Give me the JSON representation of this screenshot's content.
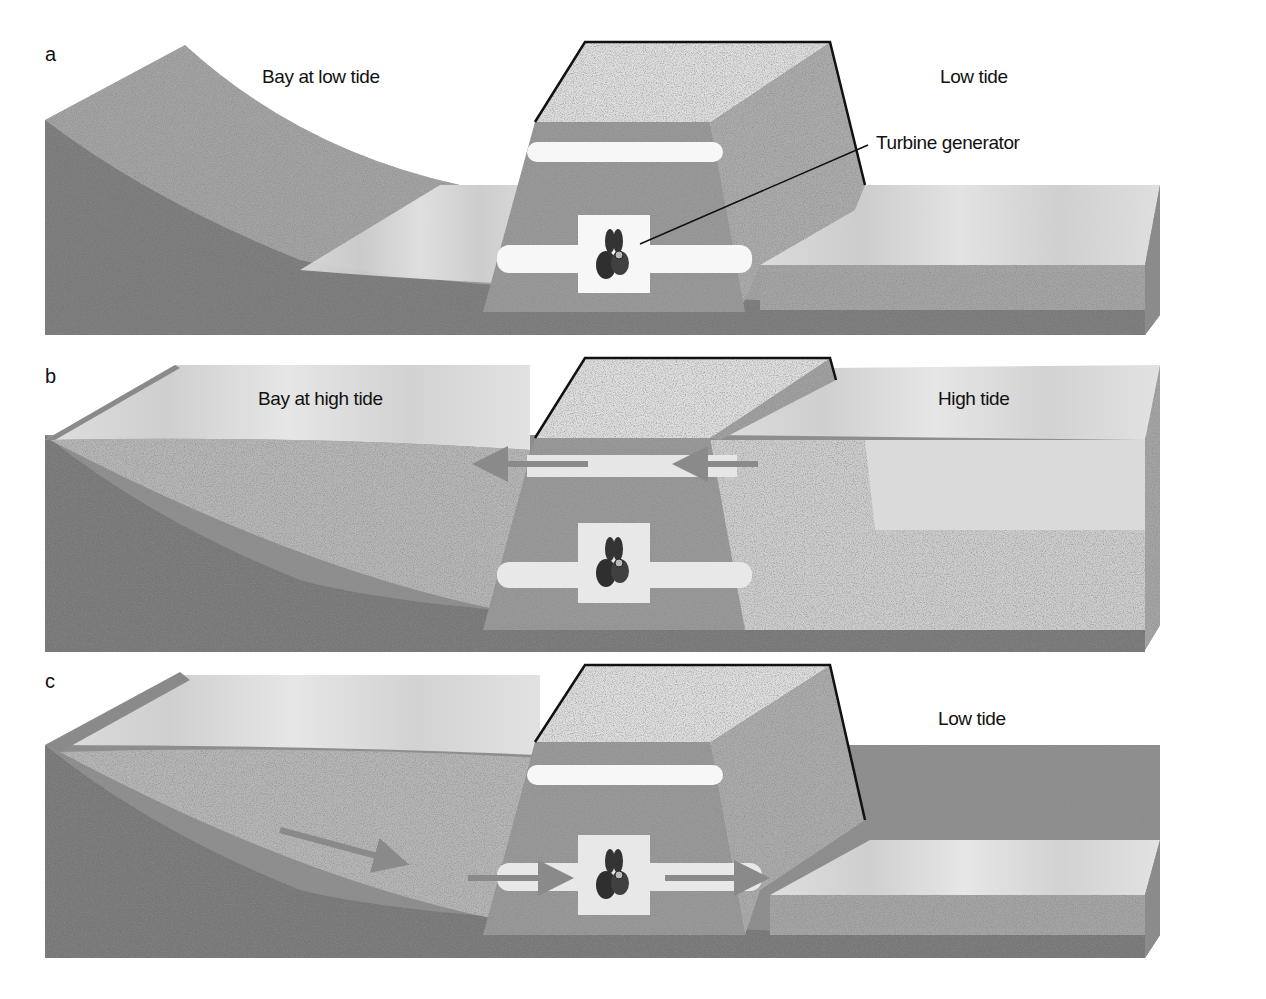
{
  "figure": {
    "panels": [
      {
        "letter": "a",
        "bay_label": "Bay at low tide",
        "sea_label": "Low tide",
        "callout": "Turbine generator"
      },
      {
        "letter": "b",
        "bay_label": "Bay at high tide",
        "sea_label": "High tide",
        "flow": "sea to bay through upper channel"
      },
      {
        "letter": "c",
        "sea_label": "Low tide",
        "flow": "bay to sea through turbine channel"
      }
    ]
  },
  "colors": {
    "background": "#ffffff",
    "land_dark": "#7d7d7d",
    "land_light": "#a9a9a9",
    "water": "#d6d6d6",
    "dam_top": "#dcdcdc",
    "dam_face": "#9a9a9a",
    "dam_side": "#b0b0b0",
    "channel": "#f6f6f6",
    "arrow": "#8a8a8a",
    "outline": "#111111"
  }
}
